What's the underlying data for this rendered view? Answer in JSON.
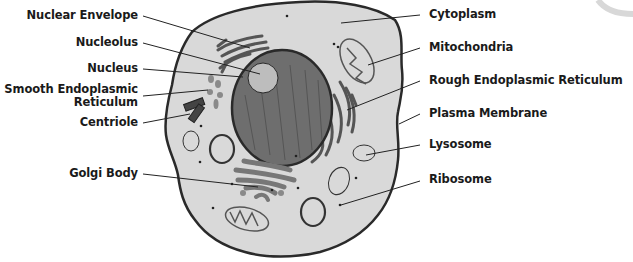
{
  "diagram": {
    "type": "labeled-diagram",
    "colors": {
      "background": "#ffffff",
      "cytoplasm": "#d9d9d9",
      "membrane": "#2a2a2a",
      "nucleus": "#6e6e6e",
      "nucleolus": "#bdbdbd",
      "organelle_dark": "#555555",
      "organelle_mid": "#8a8a8a",
      "organelle_light": "#cfcfcf",
      "label_text": "#1a1a1a",
      "leader_line": "#222222"
    },
    "left_labels": [
      {
        "id": "nuclear-envelope",
        "text": "Nuclear Envelope"
      },
      {
        "id": "nucleolus",
        "text": "Nucleolus"
      },
      {
        "id": "nucleus",
        "text": "Nucleus"
      },
      {
        "id": "smooth-er",
        "text": "Smooth Endoplasmic",
        "text2": "Reticulum"
      },
      {
        "id": "centriole",
        "text": "Centriole"
      },
      {
        "id": "golgi-body",
        "text": "Golgi Body"
      }
    ],
    "right_labels": [
      {
        "id": "cytoplasm",
        "text": "Cytoplasm"
      },
      {
        "id": "mitochondria",
        "text": "Mitochondria"
      },
      {
        "id": "rough-er",
        "text": "Rough Endoplasmic Reticulum"
      },
      {
        "id": "plasma-membrane",
        "text": "Plasma Membrane"
      },
      {
        "id": "lysosome",
        "text": "Lysosome"
      },
      {
        "id": "ribosome",
        "text": "Ribosome"
      }
    ]
  }
}
